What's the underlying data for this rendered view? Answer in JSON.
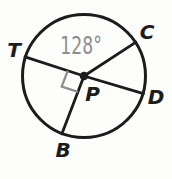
{
  "figure": {
    "type": "circle-diagram",
    "labels": {
      "T": "T",
      "C": "C",
      "D": "D",
      "B": "B",
      "P": "P",
      "angle": "128°"
    },
    "facts": {
      "center_label": "P",
      "points_on_circle": [
        "T",
        "C",
        "D",
        "B"
      ],
      "central_angle_TPC_degrees": 128,
      "right_angle_marker_between_rays": [
        "PT",
        "PB"
      ]
    },
    "colors": {
      "line": "#1c1c1c",
      "muted": "#8e8e8e",
      "background": "#fdfdfc"
    }
  }
}
